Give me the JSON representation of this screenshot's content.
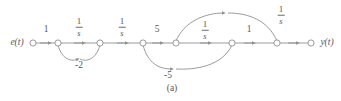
{
  "figure": {
    "caption": "(a)",
    "type": "signal-flow-graph",
    "stroke_color": "#8f9094",
    "text_color": "#58585c",
    "background": "#ffffff"
  },
  "io": {
    "input_label": "e(t)",
    "output_label": "y(t)"
  },
  "nodes": [
    {
      "id": "n0",
      "name": "input-node",
      "x": 33,
      "y": 43
    },
    {
      "id": "n1",
      "name": "node-1",
      "x": 58,
      "y": 43
    },
    {
      "id": "n2",
      "name": "node-2",
      "x": 100,
      "y": 43
    },
    {
      "id": "n3",
      "name": "node-3",
      "x": 143,
      "y": 43
    },
    {
      "id": "n4",
      "name": "node-4",
      "x": 176,
      "y": 43
    },
    {
      "id": "n5",
      "name": "node-5",
      "x": 232,
      "y": 43
    },
    {
      "id": "n6",
      "name": "node-6",
      "x": 277,
      "y": 43
    },
    {
      "id": "n7",
      "name": "output-node",
      "x": 311,
      "y": 43
    }
  ],
  "branches": [
    {
      "name": "branch-input-gain",
      "gain": "1",
      "type": "scalar",
      "from": "n0",
      "to": "n1",
      "label_x": 46,
      "label_y": 30
    },
    {
      "name": "branch-integrator-1",
      "gain": "1/s",
      "type": "fraction",
      "numerator": "1",
      "denominator": "s",
      "from": "n1",
      "to": "n2",
      "label_x": 79,
      "label_y": 27
    },
    {
      "name": "branch-integrator-2",
      "gain": "1/s",
      "type": "fraction",
      "numerator": "1",
      "denominator": "s",
      "from": "n2",
      "to": "n3",
      "label_x": 122,
      "label_y": 27
    },
    {
      "name": "branch-gain-5",
      "gain": "5",
      "type": "scalar",
      "from": "n3",
      "to": "n4",
      "label_x": 157,
      "label_y": 30
    },
    {
      "name": "branch-integrator-3",
      "gain": "1/s",
      "type": "fraction",
      "numerator": "1",
      "denominator": "s",
      "from": "n4",
      "to": "n5",
      "label_x": 205,
      "label_y": 30
    },
    {
      "name": "branch-gain-1",
      "gain": "1",
      "type": "scalar",
      "from": "n5",
      "to": "n6",
      "label_x": 249,
      "label_y": 30
    },
    {
      "name": "branch-output",
      "gain": "",
      "type": "plain",
      "from": "n6",
      "to": "n7"
    },
    {
      "name": "feedback-minus-2",
      "gain": "-2",
      "type": "scalar",
      "from": "n2",
      "to": "n1",
      "label_x": 79,
      "label_y": 66
    },
    {
      "name": "feedback-minus-5",
      "gain": "-5",
      "type": "scalar",
      "from": "n5",
      "to": "n3",
      "label_x": 168,
      "label_y": 76
    },
    {
      "name": "feedback-integrator-top",
      "gain": "1/s",
      "type": "fraction",
      "numerator": "1",
      "denominator": "s",
      "from": "n6",
      "to": "n4",
      "label_x": 281,
      "label_y": 15
    }
  ]
}
